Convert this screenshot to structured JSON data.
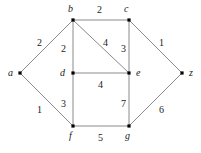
{
  "figure": {
    "kind": "weighted-undirected-graph",
    "background_color": "#ffffff",
    "edge_color": "#8a8a8a",
    "vertex_color": "#000000",
    "label_color": "#1a1a1a"
  },
  "vertices": [
    {
      "id": "a",
      "label": "a",
      "x": 20,
      "y": 73,
      "label_x": 8,
      "label_y": 68
    },
    {
      "id": "b",
      "label": "b",
      "x": 73,
      "y": 20,
      "label_x": 68,
      "label_y": 4
    },
    {
      "id": "c",
      "label": "c",
      "x": 129,
      "y": 20,
      "label_x": 124,
      "label_y": 4
    },
    {
      "id": "d",
      "label": "d",
      "x": 73,
      "y": 73,
      "label_x": 60,
      "label_y": 68
    },
    {
      "id": "e",
      "label": "e",
      "x": 129,
      "y": 73,
      "label_x": 136,
      "label_y": 68
    },
    {
      "id": "f",
      "label": "f",
      "x": 73,
      "y": 126,
      "label_x": 69,
      "label_y": 131
    },
    {
      "id": "g",
      "label": "g",
      "x": 129,
      "y": 126,
      "label_x": 125,
      "label_y": 131
    },
    {
      "id": "z",
      "label": "z",
      "x": 182,
      "y": 73,
      "label_x": 189,
      "label_y": 68
    }
  ],
  "edges": [
    {
      "id": "a-b",
      "from": "a",
      "to": "b",
      "weight": "2",
      "label_x": 37,
      "label_y": 38
    },
    {
      "id": "b-c",
      "from": "b",
      "to": "c",
      "weight": "2",
      "label_x": 97,
      "label_y": 5
    },
    {
      "id": "b-d",
      "from": "b",
      "to": "d",
      "weight": "2",
      "label_x": 61,
      "label_y": 44
    },
    {
      "id": "b-e",
      "from": "b",
      "to": "e",
      "weight": "4",
      "label_x": 103,
      "label_y": 38
    },
    {
      "id": "c-e",
      "from": "c",
      "to": "e",
      "weight": "3",
      "label_x": 121,
      "label_y": 44
    },
    {
      "id": "c-z",
      "from": "c",
      "to": "z",
      "weight": "1",
      "label_x": 159,
      "label_y": 38
    },
    {
      "id": "d-e",
      "from": "d",
      "to": "e",
      "weight": "4",
      "label_x": 98,
      "label_y": 80
    },
    {
      "id": "d-f",
      "from": "d",
      "to": "f",
      "weight": "3",
      "label_x": 61,
      "label_y": 99
    },
    {
      "id": "a-f",
      "from": "a",
      "to": "f",
      "weight": "1",
      "label_x": 37,
      "label_y": 105
    },
    {
      "id": "e-g",
      "from": "e",
      "to": "g",
      "weight": "7",
      "label_x": 121,
      "label_y": 99
    },
    {
      "id": "f-g",
      "from": "f",
      "to": "g",
      "weight": "5",
      "label_x": 98,
      "label_y": 133
    },
    {
      "id": "g-z",
      "from": "g",
      "to": "z",
      "weight": "6",
      "label_x": 159,
      "label_y": 105
    }
  ]
}
